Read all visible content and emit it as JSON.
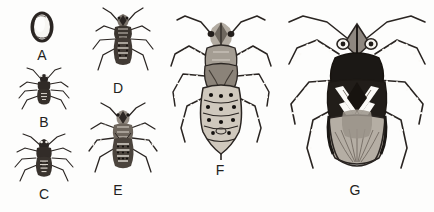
{
  "plate": {
    "title": "Hemipteran life-cycle developmental stages plate",
    "background_color": "#fdfdfc",
    "ink_color": "#231f1c",
    "width": 434,
    "height": 212,
    "style": "black-and-white stippled scientific line illustration"
  },
  "figures": [
    {
      "key": "A",
      "label": "A",
      "name": "egg",
      "stage": "egg",
      "description": "Single upright oval egg with thick dark outline and pale speckled interior",
      "relative_size": "smallest"
    },
    {
      "key": "B",
      "label": "B",
      "name": "first-instar-nymph",
      "stage": "nymph instar 1",
      "description": "Small very dark nymph, slender legs and antennae, unmarked abdomen",
      "relative_size": "very small"
    },
    {
      "key": "C",
      "label": "C",
      "name": "second-instar-nymph",
      "stage": "nymph instar 2",
      "description": "Dark nymph with faint pale spots along segmented abdomen, longer legs",
      "relative_size": "small"
    },
    {
      "key": "D",
      "label": "D",
      "name": "third-instar-nymph",
      "stage": "nymph instar 3",
      "description": "Nymph with distinct pale transverse bands and paired spots on abdomen",
      "relative_size": "small-medium"
    },
    {
      "key": "E",
      "label": "E",
      "name": "fourth-instar-nymph",
      "stage": "nymph instar 4",
      "description": "Nymph with banded legs, developing wing pads and heavily spotted abdomen",
      "relative_size": "medium"
    },
    {
      "key": "F",
      "label": "F",
      "name": "fifth-instar-nymph",
      "stage": "nymph instar 5",
      "description": "Large late-instar nymph, broad abdomen with rows of dark spots, conspicuously banded legs and prominent wing pads",
      "relative_size": "large"
    },
    {
      "key": "G",
      "label": "G",
      "name": "adult-bug",
      "stage": "adult",
      "description": "Winged adult with dark pronotum, white V-shaped chevron markings across the forewings, pale striated wing membrane, long elbowed banded antennae and banded legs",
      "relative_size": "largest"
    }
  ]
}
